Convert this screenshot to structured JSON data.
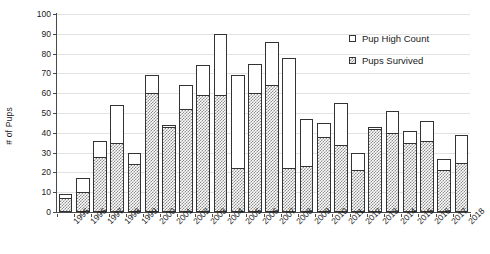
{
  "chart_data": {
    "type": "bar",
    "title": "",
    "subtitle": "",
    "xlabel": "",
    "ylabel": "# of Pups",
    "ylim": [
      0,
      100
    ],
    "ytick_step": 10,
    "yticks": [
      0,
      10,
      20,
      30,
      40,
      50,
      60,
      70,
      80,
      90,
      100
    ],
    "grid": true,
    "stacked": true,
    "legend_position": "top-right",
    "legend": [
      "Pup High Count",
      "Pups Survived"
    ],
    "categories": [
      "1995",
      "1996",
      "1997",
      "1998",
      "1999",
      "2000",
      "2001",
      "2002",
      "2003",
      "2004",
      "2005",
      "2006",
      "2007",
      "2008",
      "2009",
      "2010",
      "2011",
      "2012",
      "2013",
      "2014",
      "2015",
      "2016",
      "2017",
      "2018"
    ],
    "series": [
      {
        "name": "Pup High Count",
        "values": [
          9,
          17,
          36,
          54,
          30,
          69,
          44,
          64,
          74,
          90,
          69,
          75,
          86,
          78,
          47,
          45,
          55,
          30,
          43,
          51,
          41,
          46,
          27,
          39
        ]
      },
      {
        "name": "Pups Survived",
        "values": [
          7,
          10,
          28,
          35,
          24,
          60,
          43,
          52,
          59,
          59,
          22,
          60,
          64,
          22,
          23,
          38,
          34,
          21,
          42,
          40,
          35,
          36,
          21,
          25
        ]
      }
    ]
  },
  "legend": {
    "items": [
      {
        "label": "Pup High Count",
        "swatch": "open-square"
      },
      {
        "label": "Pups Survived",
        "swatch": "hatched-square"
      }
    ]
  },
  "axes": {
    "y_title": "# of Pups"
  }
}
